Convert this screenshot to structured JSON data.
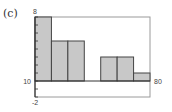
{
  "panel_label": "(c)",
  "chart_data": {
    "type": "bar",
    "subtype": "histogram",
    "title": "",
    "xlabel": "",
    "ylabel": "",
    "xlim": [
      10,
      80
    ],
    "ylim": [
      -2,
      8
    ],
    "bin_width": 10,
    "categories": [
      "10-20",
      "20-30",
      "30-40",
      "40-50",
      "50-60",
      "60-70",
      "70-80"
    ],
    "bin_edges": [
      10,
      20,
      30,
      40,
      50,
      60,
      70,
      80
    ],
    "values": [
      8,
      5,
      5,
      0,
      3,
      3,
      1
    ],
    "y_tick_step": 1,
    "tick_labels": {
      "x_min": "10",
      "x_max": "80",
      "y_max": "8",
      "y_min": "-2"
    },
    "grid": false,
    "legend": null,
    "bar_fill": "#c8c8c8",
    "bar_stroke": "#444444",
    "frame_color": "#9a9a9a"
  }
}
